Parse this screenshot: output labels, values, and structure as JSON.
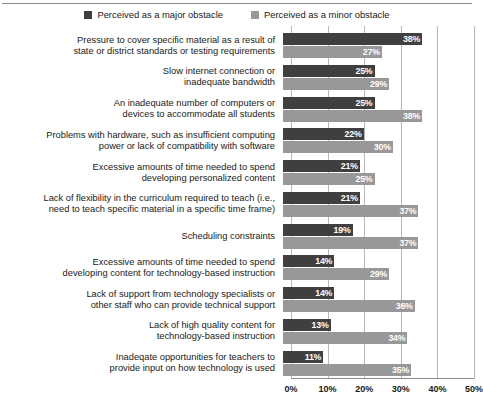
{
  "chart_data": {
    "type": "bar",
    "orientation": "horizontal",
    "title": "",
    "xlabel": "",
    "ylabel": "",
    "xlim": [
      0,
      50
    ],
    "xticks": [
      "0%",
      "10%",
      "20%",
      "30%",
      "40%",
      "50%"
    ],
    "xtick_values": [
      0,
      10,
      20,
      30,
      40,
      50
    ],
    "grid": "vertical",
    "legend_position": "top-center",
    "legend": [
      "Perceived as a major obstacle",
      "Perceived as a minor obstacle"
    ],
    "colors": {
      "major": "#3f3f3f",
      "minor": "#989898",
      "gridline": "#b8b8b8",
      "axis": "#8a8a8a",
      "background": "#ffffff",
      "text": "#1a1a1a",
      "value_label": "#ffffff"
    },
    "categories": [
      "Pressure to cover specific material as a result of state or district standards or testing requirements",
      "Slow internet connection or inadequate bandwidth",
      "An inadequate number of computers or devices to accommodate all students",
      "Problems with hardware, such as insufficient computing power or lack of compatibility with software",
      "Excessive amounts of time needed to spend developing personalized content",
      "Lack of flexibility in the curriculum required to teach (i.e., need to teach specific material in a specific time frame)",
      "Scheduling constraints",
      "Excessive amounts of time needed to spend developing content for technology-based instruction",
      "Lack of support from technology specialists or other staff who can provide technical support",
      "Lack of high quality content for technology-based instruction",
      "Inadeqate opportunities for teachers to provide input on how technology is used"
    ],
    "category_lines": [
      [
        "Pressure to cover specific material as a result of",
        "state or district standards or testing requirements"
      ],
      [
        "Slow internet connection or",
        "inadequate bandwidth"
      ],
      [
        "An inadequate number of computers or",
        "devices to accommodate all students"
      ],
      [
        "Problems with hardware, such as insufficient computing",
        "power or lack of compatibility with software"
      ],
      [
        "Excessive amounts of time needed to spend",
        "developing personalized content"
      ],
      [
        "Lack of flexibility in the curriculum required to teach (i.e.,",
        "need to teach specific material in a specific time frame)"
      ],
      [
        "Scheduling constraints"
      ],
      [
        "Excessive amounts of time needed to spend",
        "developing content for technology-based instruction"
      ],
      [
        "Lack of support from technology specialists or",
        "other staff who can provide technical support"
      ],
      [
        "Lack of high quality content for",
        "technology-based instruction"
      ],
      [
        "Inadeqate opportunities for teachers to",
        "provide input on how technology is used"
      ]
    ],
    "series": [
      {
        "name": "Perceived as a major obstacle",
        "values": [
          38,
          25,
          25,
          22,
          21,
          21,
          19,
          14,
          14,
          13,
          11
        ],
        "labels": [
          "38%",
          "25%",
          "25%",
          "22%",
          "21%",
          "21%",
          "19%",
          "14%",
          "14%",
          "13%",
          "11%"
        ]
      },
      {
        "name": "Perceived as a minor obstacle",
        "values": [
          27,
          29,
          38,
          30,
          25,
          37,
          37,
          29,
          36,
          34,
          35
        ],
        "labels": [
          "27%",
          "29%",
          "38%",
          "30%",
          "25%",
          "37%",
          "37%",
          "29%",
          "36%",
          "34%",
          "35%"
        ]
      }
    ]
  }
}
